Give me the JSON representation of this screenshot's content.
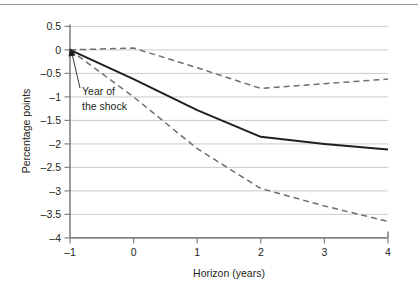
{
  "chart_data": {
    "type": "line",
    "title": "",
    "subtitle": "",
    "xlabel": "Horizon (years)",
    "ylabel": "Percentage points",
    "x": [
      -1,
      0,
      1,
      2,
      3,
      4
    ],
    "xlim": [
      -1,
      4
    ],
    "ylim": [
      -4,
      0.5
    ],
    "xticks": [
      -1,
      0,
      1,
      2,
      3,
      4
    ],
    "xtick_labels": [
      "–1",
      "0",
      "1",
      "2",
      "3",
      "4"
    ],
    "yticks": [
      0.5,
      0,
      -0.5,
      -1,
      -1.5,
      -2,
      -2.5,
      -3,
      -3.5,
      -4
    ],
    "ytick_labels": [
      "0.5",
      "0",
      "–0.5",
      "–1",
      "–1.5",
      "–2",
      "–2.5",
      "–3",
      "–3.5",
      "–4"
    ],
    "grid": true,
    "grid_axis": "y",
    "legend": false,
    "legend_position": "none",
    "series": [
      {
        "name": "Point estimate",
        "style": "solid",
        "color": "#231f20",
        "values": [
          0.0,
          -0.62,
          -1.28,
          -1.85,
          -2.0,
          -2.12
        ]
      },
      {
        "name": "Upper confidence band",
        "style": "dashed",
        "color": "#6d6e71",
        "values": [
          0.0,
          0.04,
          -0.38,
          -0.82,
          -0.72,
          -0.62
        ]
      },
      {
        "name": "Lower confidence band",
        "style": "dashed",
        "color": "#6d6e71",
        "values": [
          0.0,
          -1.0,
          -2.1,
          -2.95,
          -3.32,
          -3.65
        ]
      }
    ],
    "annotations": [
      {
        "name": "year-of-the-shock",
        "lines": [
          "Year of",
          "the shock"
        ],
        "points_to_x": -1,
        "points_to_y": 0
      }
    ]
  },
  "axes": {
    "ylabel": "Percentage points",
    "xlabel": "Horizon (years)"
  },
  "annotation": {
    "line1": "Year of",
    "line2": "the shock"
  },
  "colors": {
    "solid_line": "#231f20",
    "dashed_line": "#6d6e71",
    "gridline": "#bcbec0",
    "axis": "#808285",
    "text": "#231f20",
    "background": "#ffffff"
  }
}
